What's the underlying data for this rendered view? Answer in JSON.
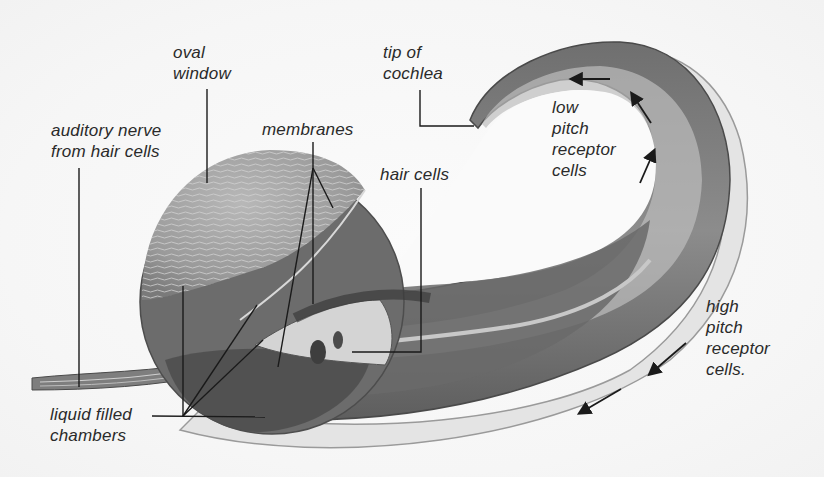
{
  "diagram": {
    "colors": {
      "background": "#f5f5f5",
      "outer_tube": "#8a8a8a",
      "outer_tube_dark": "#5a5a5a",
      "inner_band": "#d8d8d8",
      "oval_window": "#a0a0a0",
      "chamber_dark": "#555555",
      "leader_line": "#1a1a1a",
      "text": "#2a2a2a"
    },
    "labels": {
      "oval_window": "oval\nwindow",
      "tip_of_cochlea": "tip of\ncochlea",
      "auditory_nerve": "auditory nerve\nfrom hair cells",
      "membranes": "membranes",
      "hair_cells": "hair cells",
      "low_pitch": "low\npitch\nreceptor\ncells",
      "high_pitch": "high\npitch\nreceptor\ncells.",
      "liquid_chambers": "liquid filled\nchambers"
    },
    "arrows": {
      "low_pitch": 3,
      "high_pitch": 2
    }
  }
}
